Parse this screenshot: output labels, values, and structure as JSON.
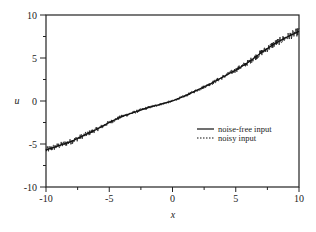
{
  "chart_data": {
    "type": "line",
    "title": "",
    "xlabel": "x",
    "ylabel": "u",
    "xlim": [
      -10,
      10
    ],
    "ylim": [
      -10,
      10
    ],
    "xticks": [
      -10,
      -5,
      0,
      5,
      10
    ],
    "yticks": [
      -10,
      -5,
      0,
      5,
      10
    ],
    "x_tick_labels": [
      "-10",
      "-5",
      "0",
      "5",
      "10"
    ],
    "y_tick_labels": [
      "-10",
      "-5",
      "0",
      "5",
      "10"
    ],
    "grid": false,
    "legend_position": "center-right",
    "x": [
      -10,
      -9,
      -8,
      -7,
      -6,
      -5,
      -4,
      -3,
      -2,
      -1,
      0,
      1,
      2,
      3,
      4,
      5,
      6,
      7,
      8,
      9,
      10
    ],
    "series": [
      {
        "name": "noise-free input",
        "style": "solid",
        "values": [
          -5.7,
          -5.2,
          -4.7,
          -4.0,
          -3.3,
          -2.5,
          -1.8,
          -1.3,
          -0.8,
          -0.4,
          0.0,
          0.6,
          1.3,
          2.0,
          2.8,
          3.6,
          4.5,
          5.6,
          6.6,
          7.4,
          8.1
        ]
      },
      {
        "name": "noisy input",
        "style": "dotted",
        "values": [
          -5.7,
          -5.2,
          -4.7,
          -4.0,
          -3.3,
          -2.5,
          -1.8,
          -1.3,
          -0.8,
          -0.4,
          0.0,
          0.6,
          1.3,
          2.0,
          2.8,
          3.6,
          4.5,
          5.6,
          6.6,
          7.4,
          8.1
        ],
        "noise_amplitude": 0.35
      }
    ]
  },
  "axes": {
    "xlabel": "x",
    "ylabel": "u"
  },
  "legend": {
    "items": [
      {
        "label": "noise-free input",
        "style": "solid"
      },
      {
        "label": "noisy input",
        "style": "dotted"
      }
    ]
  }
}
